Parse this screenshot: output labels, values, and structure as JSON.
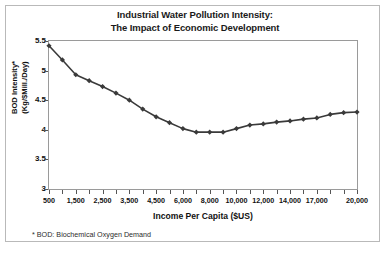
{
  "figure": {
    "footnote": "*  BOD:  Biochemical Oxygen Demand",
    "frame_color": "#b9b9b9"
  },
  "chart_data": {
    "type": "line",
    "title": "Industrial Water Pollution Intensity:",
    "subtitle": "The Impact of Economic Development",
    "xlabel": "Income Per Capita ($US)",
    "ylabel": "BOD Intensity*",
    "ylabel_units": "(Kg/$Mill./Day)",
    "ylim": [
      3,
      5.5
    ],
    "yticks": [
      3,
      3.5,
      4,
      4.5,
      5,
      5.5
    ],
    "ytick_labels": [
      "3",
      "3.5",
      "4",
      "4.5",
      "5",
      "5.5"
    ],
    "grid": false,
    "legend": "none",
    "series_color": "#3a3a3a",
    "marker": "diamond",
    "axis_type": "categorical",
    "x_tick_count": 24,
    "xtick_labels": [
      "500",
      "1,500",
      "2,500",
      "3,500",
      "4,500",
      "6,000",
      "8,000",
      "10,000",
      "12,000",
      "14,000",
      "17,000",
      "20,000"
    ],
    "xtick_label_positions": [
      0,
      2,
      4,
      6,
      8,
      10,
      12,
      14,
      16,
      18,
      20,
      23
    ],
    "categories": [
      "500",
      "1,000",
      "1,500",
      "2,000",
      "2,500",
      "3,000",
      "3,500",
      "4,000",
      "4,500",
      "5,000",
      "6,000",
      "7,000",
      "8,000",
      "9,000",
      "10,000",
      "11,000",
      "12,000",
      "13,000",
      "14,000",
      "15,000",
      "17,000",
      "18,000",
      "19,000",
      "20,000"
    ],
    "values": [
      5.42,
      5.18,
      4.93,
      4.83,
      4.73,
      4.62,
      4.5,
      4.35,
      4.22,
      4.12,
      4.02,
      3.96,
      3.96,
      3.96,
      4.02,
      4.08,
      4.1,
      4.13,
      4.15,
      4.18,
      4.2,
      4.26,
      4.29,
      4.3
    ]
  }
}
